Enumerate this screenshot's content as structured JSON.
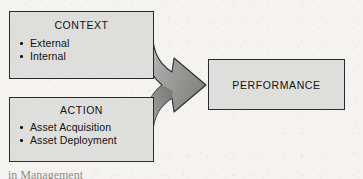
{
  "figure": {
    "type": "flow-diagram",
    "background_color": "#f4f3f1",
    "node_fill_color": "#dededc",
    "node_border_color": "#2b2b2b",
    "text_color": "#121212",
    "arrow_fill_color": "#8f8f8f"
  },
  "nodes": {
    "context": {
      "title": "CONTEXT",
      "bullets": [
        {
          "label": "External"
        },
        {
          "label": "Internal"
        }
      ]
    },
    "action": {
      "title": "ACTION",
      "bullets": [
        {
          "label": "Asset Acquisition"
        },
        {
          "label": "Asset Deployment"
        }
      ]
    },
    "performance": {
      "title": "PERFORMANCE"
    }
  },
  "arrow": {
    "name": "merge-arrow",
    "from": [
      "CONTEXT",
      "ACTION"
    ],
    "to": "PERFORMANCE",
    "style": "curved-merging-block-arrow"
  },
  "caption": {
    "clipped_text": "in Management"
  }
}
